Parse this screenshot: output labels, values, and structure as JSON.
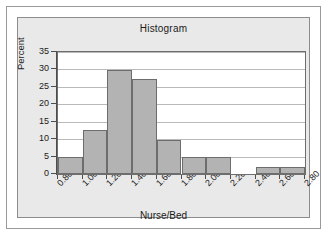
{
  "figure": {
    "panel_background": "#e9e9e9",
    "plot_background": "#ffffff",
    "bar_fill": "#b3b3b3",
    "bar_stroke": "#6d6d6d",
    "gridline_color": "#b9b9b9",
    "axis_color": "#4d4d4d"
  },
  "chart_data": {
    "type": "bar",
    "title": "Histogram",
    "xlabel": "Nurse/Bed",
    "ylabel": "Percent",
    "xlim": [
      0.8,
      2.8
    ],
    "ylim": [
      0,
      35
    ],
    "ytick_labels": [
      "0",
      "5",
      "10",
      "15",
      "20",
      "25",
      "30",
      "35"
    ],
    "ytick_values": [
      0,
      5,
      10,
      15,
      20,
      25,
      30,
      35
    ],
    "xtick_labels": [
      "0.80",
      "1.00",
      "1.20",
      "1.40",
      "1.60",
      "1.80",
      "2.00",
      "2.20",
      "2.40",
      "2.60",
      "2.80"
    ],
    "xtick_values": [
      0.8,
      1.0,
      1.2,
      1.4,
      1.6,
      1.8,
      2.0,
      2.2,
      2.4,
      2.6,
      2.8
    ],
    "xtick_rotation": -45,
    "grid": "horizontal",
    "legend": "none",
    "bin_width": 0.2,
    "bins": [
      {
        "label": "0.80-1.00",
        "start": 0.8,
        "end": 1.0,
        "value": 5.0
      },
      {
        "label": "1.00-1.20",
        "start": 1.0,
        "end": 1.2,
        "value": 12.5
      },
      {
        "label": "1.20-1.40",
        "start": 1.2,
        "end": 1.4,
        "value": 29.8
      },
      {
        "label": "1.40-1.60",
        "start": 1.4,
        "end": 1.6,
        "value": 27.4
      },
      {
        "label": "1.60-1.80",
        "start": 1.6,
        "end": 1.8,
        "value": 9.8
      },
      {
        "label": "1.80-2.00",
        "start": 1.8,
        "end": 2.0,
        "value": 4.9
      },
      {
        "label": "2.00-2.20",
        "start": 2.0,
        "end": 2.2,
        "value": 4.9
      },
      {
        "label": "2.20-2.40",
        "start": 2.2,
        "end": 2.4,
        "value": 0.0
      },
      {
        "label": "2.40-2.60",
        "start": 2.4,
        "end": 2.6,
        "value": 2.0
      },
      {
        "label": "2.60-2.80",
        "start": 2.6,
        "end": 2.8,
        "value": 2.0
      }
    ],
    "categories": [
      "0.80-1.00",
      "1.00-1.20",
      "1.20-1.40",
      "1.40-1.60",
      "1.60-1.80",
      "1.80-2.00",
      "2.00-2.20",
      "2.20-2.40",
      "2.40-2.60",
      "2.60-2.80"
    ],
    "values": [
      5.0,
      12.5,
      29.8,
      27.4,
      9.8,
      4.9,
      4.9,
      0.0,
      2.0,
      2.0
    ]
  }
}
